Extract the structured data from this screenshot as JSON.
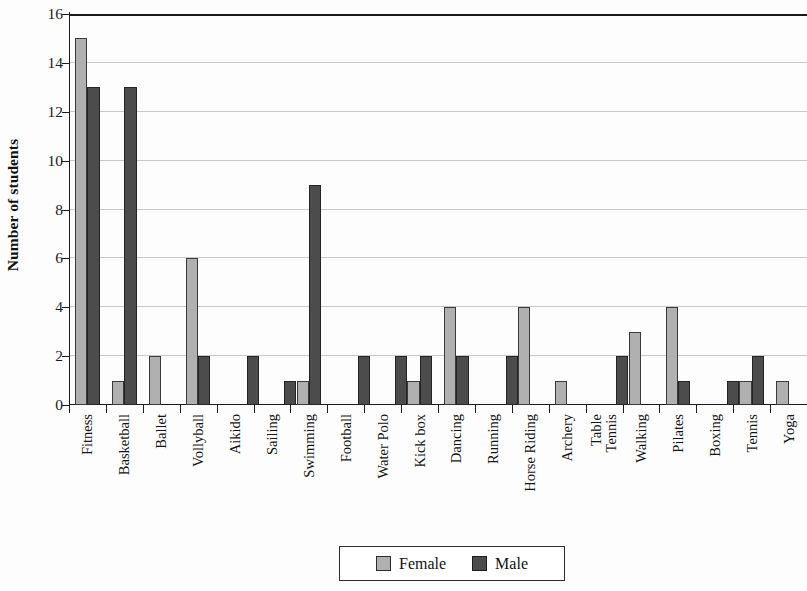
{
  "chart_data": {
    "type": "bar",
    "title": "",
    "subtitle": "",
    "xlabel": "",
    "ylabel": "Number of students",
    "ylim": [
      0,
      16
    ],
    "ytick_step": 2,
    "yticks": [
      0,
      2,
      4,
      6,
      8,
      10,
      12,
      14,
      16
    ],
    "ytick_labels": [
      "0",
      "2",
      "4",
      "6",
      "8",
      "10",
      "12",
      "14",
      "16"
    ],
    "grid": true,
    "grid_axis": "y",
    "legend_position": "bottom-center",
    "categories": [
      "Fitness",
      "Basketball",
      "Ballet",
      "Vollyball",
      "Aikido",
      "Sailing",
      "Swimming",
      "Football",
      "Water Polo",
      "Kick box",
      "Dancing",
      "Running",
      "Horse Riding",
      "Archery",
      "Table Tennis",
      "Walking",
      "Pilates",
      "Boxing",
      "Tennis",
      "Yoga"
    ],
    "category_label_lines": [
      [
        "Fitness"
      ],
      [
        "Basketball"
      ],
      [
        "Ballet"
      ],
      [
        "Vollyball"
      ],
      [
        "Aikido"
      ],
      [
        "Sailing"
      ],
      [
        "Swimming"
      ],
      [
        "Football"
      ],
      [
        "Water Polo"
      ],
      [
        "Kick box"
      ],
      [
        "Dancing"
      ],
      [
        "Running"
      ],
      [
        "Horse Riding"
      ],
      [
        "Archery"
      ],
      [
        "Table",
        "Tennis"
      ],
      [
        "Walking"
      ],
      [
        "Pilates"
      ],
      [
        "Boxing"
      ],
      [
        "Tennis"
      ],
      [
        "Yoga"
      ]
    ],
    "series": [
      {
        "name": "Female",
        "color": "#b0b0b0",
        "values": [
          15,
          1,
          2,
          6,
          0,
          0,
          1,
          0,
          0,
          1,
          4,
          0,
          4,
          1,
          0,
          3,
          4,
          0,
          1,
          1
        ]
      },
      {
        "name": "Male",
        "color": "#4c4c4c",
        "values": [
          13,
          13,
          0,
          2,
          2,
          1,
          9,
          2,
          2,
          2,
          2,
          2,
          0,
          0,
          2,
          0,
          1,
          1,
          2,
          0
        ]
      }
    ]
  },
  "legend": {
    "entries": [
      {
        "label": "Female",
        "color": "#b0b0b0"
      },
      {
        "label": "Male",
        "color": "#4c4c4c"
      }
    ]
  },
  "colors": {
    "female": "#b0b0b0",
    "male": "#4c4c4c",
    "axis": "#1b1b1b",
    "gridline": "#c9c9c9",
    "background": "#fdfdfd"
  }
}
